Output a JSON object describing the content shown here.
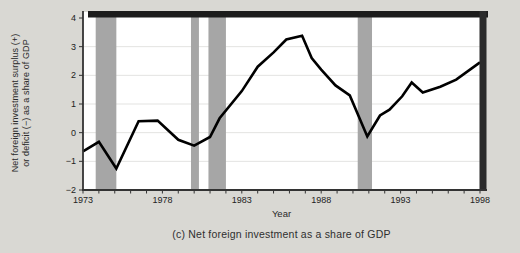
{
  "figure": {
    "caption": "(c) Net foreign investment as a share of GDP",
    "background_color": "#d9d8d3"
  },
  "chart_data": {
    "type": "line",
    "title": "",
    "xlabel": "Year",
    "ylabel_line1": "Net foreign investment surplus (+)",
    "ylabel_line2": "or deficit (−) as a share of GDP",
    "xlim": [
      1973,
      1998
    ],
    "ylim": [
      -2,
      4
    ],
    "x_ticks": [
      1973,
      1978,
      1983,
      1988,
      1993,
      1998
    ],
    "x_minor_tick_step": 1,
    "y_ticks": [
      4,
      3,
      2,
      1,
      0,
      -1,
      -2
    ],
    "grid_values": [
      3,
      2,
      1,
      0,
      -1
    ],
    "legend": "none",
    "series": [
      {
        "name": "Net foreign investment as a share of GDP",
        "points": [
          [
            1973.0,
            -0.65
          ],
          [
            1974.0,
            -0.32
          ],
          [
            1975.1,
            -1.25
          ],
          [
            1976.5,
            0.4
          ],
          [
            1977.7,
            0.42
          ],
          [
            1979.0,
            -0.25
          ],
          [
            1980.0,
            -0.45
          ],
          [
            1981.0,
            -0.15
          ],
          [
            1981.6,
            0.5
          ],
          [
            1983.0,
            1.45
          ],
          [
            1984.0,
            2.3
          ],
          [
            1985.0,
            2.8
          ],
          [
            1985.8,
            3.25
          ],
          [
            1986.8,
            3.38
          ],
          [
            1987.4,
            2.6
          ],
          [
            1988.0,
            2.2
          ],
          [
            1988.9,
            1.65
          ],
          [
            1989.8,
            1.3
          ],
          [
            1990.9,
            -0.13
          ],
          [
            1991.7,
            0.6
          ],
          [
            1992.3,
            0.8
          ],
          [
            1993.1,
            1.27
          ],
          [
            1993.7,
            1.75
          ],
          [
            1994.4,
            1.4
          ],
          [
            1995.5,
            1.6
          ],
          [
            1996.5,
            1.85
          ],
          [
            1998.0,
            2.45
          ]
        ]
      }
    ],
    "recession_bands": [
      [
        1973.8,
        1975.1
      ],
      [
        1979.8,
        1980.3
      ],
      [
        1980.9,
        1982.0
      ],
      [
        1990.3,
        1991.2
      ]
    ],
    "colors": {
      "line": "#000000",
      "band": "#a6a6a6",
      "grid": "#e3e3e1",
      "frame_heavy": "#1c1c1c",
      "axis": "#333333",
      "plot_bg": "#ffffff",
      "text": "#222222"
    }
  }
}
